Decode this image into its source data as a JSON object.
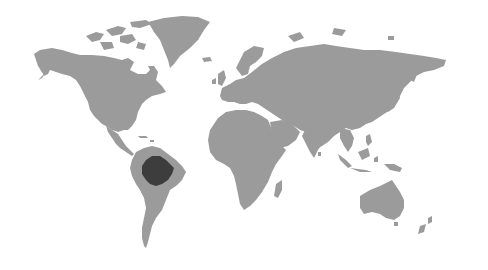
{
  "map": {
    "type": "world-map",
    "style": "grayscale",
    "colors": {
      "background": "#ffffff",
      "land": "#9b9b9b",
      "highlight": "#3d3d3d"
    },
    "highlighted_region": "amazon-basin",
    "regions": [
      "north-america",
      "greenland",
      "canadian-arctic-islands",
      "central-america",
      "south-america",
      "europe",
      "africa",
      "madagascar",
      "asia",
      "arabian-peninsula",
      "indian-subcontinent",
      "southeast-asia",
      "indonesia",
      "japan",
      "new-guinea",
      "australia",
      "new-zealand",
      "uk-ireland",
      "iceland"
    ]
  }
}
